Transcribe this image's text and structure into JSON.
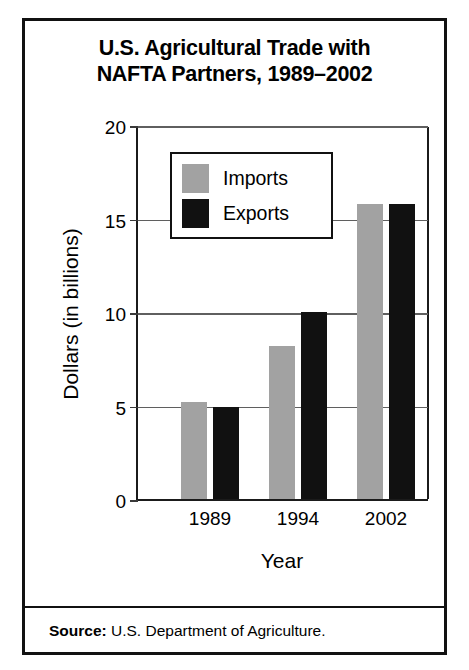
{
  "chart_data": {
    "type": "bar",
    "title": "U.S. Agricultural Trade with NAFTA Partners, 1989–2002",
    "title_lines": [
      "U.S. Agricultural Trade with",
      "NAFTA Partners, 1989–2002"
    ],
    "xlabel": "Year",
    "ylabel": "Dollars (in billions)",
    "categories": [
      "1989",
      "1994",
      "2002"
    ],
    "series": [
      {
        "name": "Imports",
        "color": "#a2a2a2",
        "values": [
          5.2,
          8.2,
          15.8
        ]
      },
      {
        "name": "Exports",
        "color": "#111111",
        "values": [
          4.9,
          10.0,
          15.75
        ]
      }
    ],
    "ylim": [
      0,
      20
    ],
    "yticks": [
      0,
      5,
      10,
      15,
      20
    ],
    "ytick_labels": [
      "0",
      "5",
      "10",
      "15",
      "20"
    ],
    "grid": true,
    "legend_position": "upper-left-inside"
  },
  "legend": {
    "entries": [
      {
        "label": "Imports",
        "swatch": "gray-swatch"
      },
      {
        "label": "Exports",
        "swatch": "black-swatch"
      }
    ]
  },
  "source": {
    "label": "Source:",
    "text": " U.S. Department of Agriculture."
  }
}
